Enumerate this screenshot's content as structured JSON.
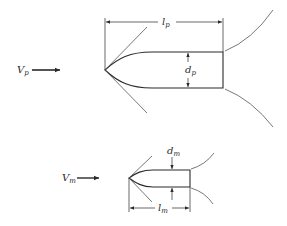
{
  "diagram": {
    "type": "prototype-model similarity sketch (projectile with attached shock waves)",
    "prototype": {
      "velocity_label": "V",
      "velocity_subscript": "p",
      "length_label": "l",
      "length_subscript": "p",
      "diameter_label": "d",
      "diameter_subscript": "p"
    },
    "model": {
      "velocity_label": "V",
      "velocity_subscript": "m",
      "length_label": "l",
      "length_subscript": "m",
      "diameter_label": "d",
      "diameter_subscript": "m"
    },
    "colors": {
      "line": "#2a2a2a",
      "thin_line": "#555555",
      "background": "#ffffff"
    }
  }
}
